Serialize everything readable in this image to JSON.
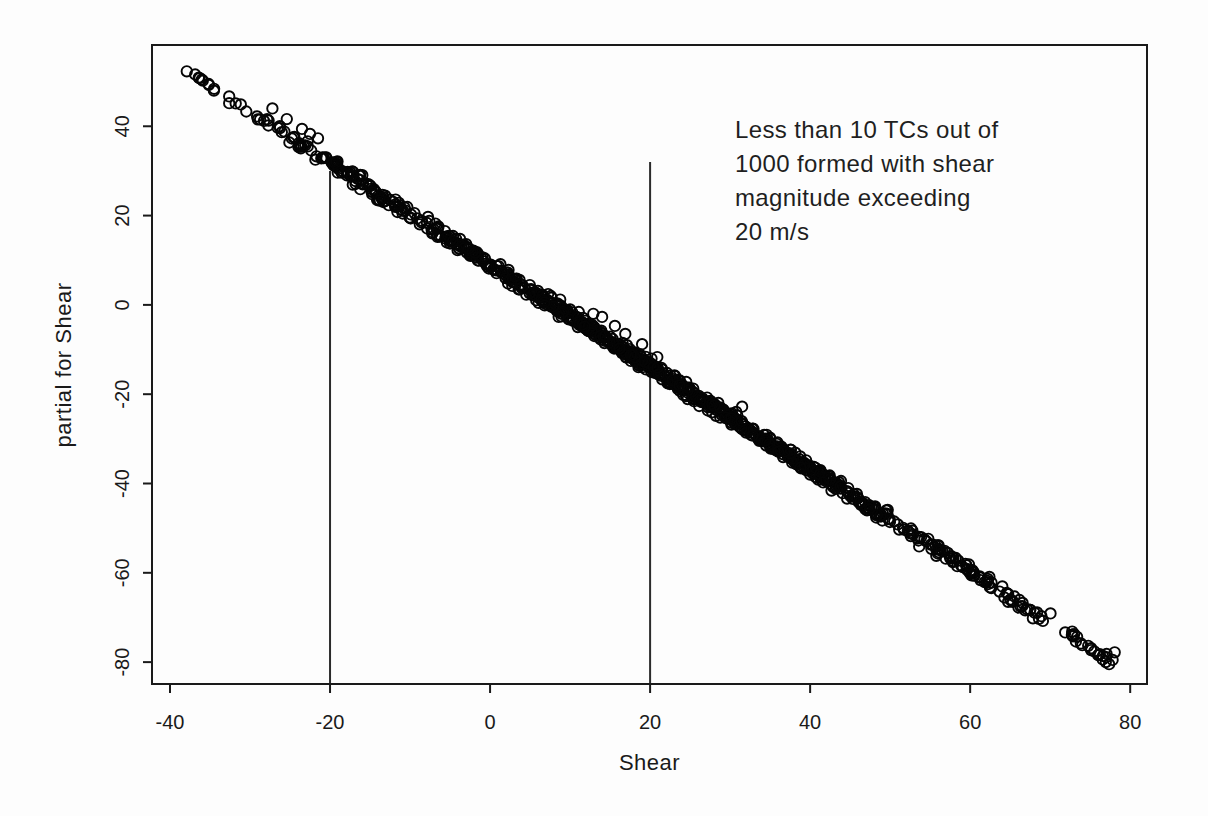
{
  "chart_data": {
    "type": "scatter",
    "title": "",
    "xlabel": "Shear",
    "ylabel": "partial for Shear",
    "x_ticks": [
      -40,
      -20,
      0,
      20,
      40,
      60,
      80
    ],
    "y_ticks": [
      40,
      20,
      0,
      -20,
      -40,
      -60,
      -80
    ],
    "xlim": [
      -42.25,
      82.1
    ],
    "ylim": [
      -84.9,
      58.2
    ],
    "grid": false,
    "legend": "none",
    "marker": "open-circle",
    "annotation": {
      "lines": [
        "Less than 10 TCs out of",
        "1000 formed with shear",
        "magnitude exceeding",
        "20 m/s"
      ],
      "anchor": {
        "x": 30.6,
        "y": 43
      }
    },
    "reference_lines": [
      {
        "x": -20,
        "y_top": 30
      },
      {
        "x": 20,
        "y_top": 32
      }
    ],
    "trend_band": {
      "description": "dense band of 1000 open circles along line partial = intercept + slope * shear",
      "n_points": 1000,
      "slope": -1.143,
      "intercept": 9.0,
      "shear_mean": 20,
      "shear_sd": 28,
      "shear_range": [
        -37.6,
        78.2
      ],
      "residual_sd": 0.7,
      "seed": 11
    },
    "notable_points": [
      [
        -37.9,
        52.3
      ],
      [
        -36.4,
        50.9
      ],
      [
        -27.2,
        44.0
      ],
      [
        -25.4,
        41.6
      ],
      [
        -23.5,
        39.4
      ],
      [
        -22.5,
        38.3
      ],
      [
        -21.5,
        37.3
      ],
      [
        12.9,
        -2.0
      ],
      [
        14.0,
        -2.7
      ],
      [
        15.6,
        -4.7
      ],
      [
        16.9,
        -6.5
      ],
      [
        19.0,
        -8.8
      ],
      [
        20.9,
        -11.7
      ],
      [
        31.5,
        -22.8
      ],
      [
        74.0,
        -76.2
      ],
      [
        75.1,
        -77.3
      ],
      [
        76.2,
        -78.2
      ],
      [
        77.0,
        -78.9
      ],
      [
        77.8,
        -79.5
      ]
    ],
    "colors": {
      "points": "#050505",
      "frame": "#1a1a1a",
      "reference_line": "#2b2b2b",
      "text": "#1a1a1a",
      "background": "#fdfdfd"
    }
  }
}
